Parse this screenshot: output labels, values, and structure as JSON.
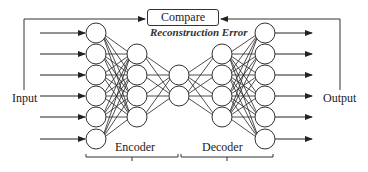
{
  "diagram": {
    "type": "autoencoder",
    "compare_label": "Compare",
    "error_label": "Reconstruction Error",
    "input_label": "Input",
    "output_label": "Output",
    "encoder_label": "Encoder",
    "decoder_label": "Decoder",
    "layers": [
      {
        "name": "input",
        "x": 96,
        "nodes": [
          33,
          54,
          75,
          96,
          117,
          139
        ]
      },
      {
        "name": "encoder-hidden",
        "x": 137,
        "nodes": [
          54,
          75,
          96,
          117
        ]
      },
      {
        "name": "bottleneck",
        "x": 179,
        "nodes": [
          75,
          96
        ]
      },
      {
        "name": "decoder-hidden",
        "x": 222,
        "nodes": [
          54,
          75,
          96,
          117
        ]
      },
      {
        "name": "output",
        "x": 265,
        "nodes": [
          33,
          54,
          75,
          96,
          117,
          139
        ]
      }
    ],
    "node_radius": 10,
    "colors": {
      "stroke": "#333333",
      "background": "#ffffff"
    }
  }
}
